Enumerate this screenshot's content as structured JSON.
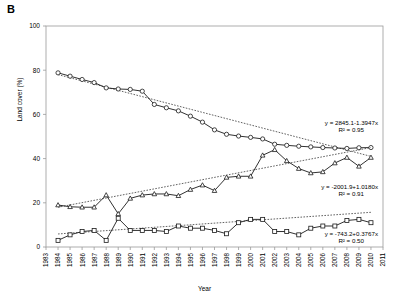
{
  "panel": {
    "label": "B"
  },
  "axes": {
    "ylabel": "Land cover (%)",
    "xlabel": "Year",
    "yticks": [
      "0",
      "20",
      "40",
      "60",
      "80",
      "100"
    ],
    "xticks": [
      "1983",
      "1984",
      "1985",
      "1986",
      "1987",
      "1988",
      "1989",
      "1990",
      "1991",
      "1992",
      "1993",
      "1994",
      "1995",
      "1996",
      "1997",
      "1998",
      "1999",
      "2000",
      "2001",
      "2002",
      "2003",
      "2004",
      "2005",
      "2006",
      "2007",
      "2008",
      "2009",
      "2010",
      "2011"
    ]
  },
  "annotations": {
    "eq1_line1": "y = 2845.1-1.3947x",
    "eq1_line2": "R² = 0.95",
    "eq2_line1": "y = -2001.9+1.0180x",
    "eq2_line2": "R² = 0.91",
    "eq3_line1": "y = -743.2+0.3767x",
    "eq3_line2": "R² = 0.50"
  },
  "chart_data": {
    "type": "line",
    "title": "",
    "xlabel": "Year",
    "ylabel": "Land cover (%)",
    "xlim": [
      1983,
      2011
    ],
    "ylim": [
      0,
      100
    ],
    "yticks": [
      0,
      20,
      40,
      60,
      80,
      100
    ],
    "grid": false,
    "legend": "none",
    "x": [
      1984,
      1985,
      1986,
      1987,
      1988,
      1989,
      1990,
      1991,
      1992,
      1993,
      1994,
      1995,
      1996,
      1997,
      1998,
      1999,
      2000,
      2001,
      2002,
      2003,
      2004,
      2005,
      2006,
      2007,
      2008,
      2009,
      2010
    ],
    "series": [
      {
        "name": "upper series",
        "marker": "open-circle",
        "values": [
          78.8,
          77.3,
          75.8,
          74.4,
          72.0,
          71.5,
          71.3,
          70.5,
          64.5,
          63.0,
          61.6,
          59.2,
          56.5,
          53.0,
          51.0,
          50.2,
          49.6,
          48.9,
          46.5,
          46.0,
          45.6,
          45.3,
          45.0,
          44.8,
          44.6,
          44.9,
          45.0
        ],
        "trend": {
          "equation": "y = 2845.1-1.3947x",
          "r2": 0.95,
          "intercept": 2845.1,
          "slope": -1.3947,
          "endpoints_y": [
            78.0,
            41.0
          ]
        }
      },
      {
        "name": "middle series",
        "marker": "open-triangle",
        "values": [
          19.0,
          18.2,
          18.0,
          18.0,
          23.5,
          15.0,
          22.0,
          23.5,
          24.0,
          24.0,
          23.2,
          26.0,
          28.0,
          25.5,
          31.5,
          32.0,
          32.0,
          41.5,
          44.0,
          39.0,
          35.5,
          33.5,
          34.0,
          38.0,
          40.5,
          36.5,
          40.5
        ],
        "trend": {
          "equation": "y = -2001.9+1.0180x",
          "r2": 0.91,
          "intercept": -2001.9,
          "slope": 1.018,
          "endpoints_y": [
            18.0,
            45.0
          ]
        }
      },
      {
        "name": "lower series",
        "marker": "open-square",
        "values": [
          3.0,
          5.5,
          7.0,
          7.5,
          3.0,
          13.0,
          7.5,
          7.5,
          7.5,
          7.0,
          9.5,
          8.5,
          8.5,
          7.5,
          6.0,
          11.0,
          12.5,
          12.5,
          7.0,
          7.0,
          5.5,
          8.5,
          9.5,
          9.5,
          12.0,
          12.5,
          11.0
        ],
        "trend": {
          "equation": "y = -743.2+0.3767x",
          "r2": 0.5,
          "intercept": -743.2,
          "slope": 0.3767,
          "endpoints_y": [
            5.9,
            15.7
          ]
        }
      }
    ]
  }
}
